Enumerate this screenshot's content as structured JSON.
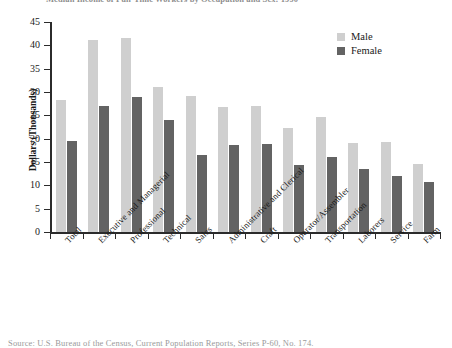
{
  "chart_data": {
    "type": "bar",
    "title": "Median Income of Full-Time Workers by Occupation and Sex: 1990",
    "xlabel": "",
    "ylabel": "Dollars (Thousands)",
    "ylim": [
      0,
      45
    ],
    "yticks": [
      0,
      5,
      10,
      15,
      20,
      25,
      30,
      35,
      40,
      45
    ],
    "grid": false,
    "legend_position": "top-right",
    "categories": [
      "Total",
      "Executive and Managerial",
      "Professional",
      "Technical",
      "Sales",
      "Administrative and Clerical",
      "Craft",
      "Operator/Assembler",
      "Transportation",
      "Laborers",
      "Service",
      "Farm"
    ],
    "series": [
      {
        "name": "Male",
        "color": "#cfcfcf",
        "values": [
          28.3,
          41.2,
          41.6,
          31.0,
          29.2,
          26.8,
          26.9,
          22.3,
          24.6,
          19.0,
          19.3,
          14.5
        ]
      },
      {
        "name": "Female",
        "color": "#636363",
        "values": [
          19.6,
          27.1,
          28.9,
          23.9,
          16.6,
          18.7,
          18.8,
          14.4,
          16.1,
          13.6,
          12.1,
          10.8
        ]
      }
    ]
  },
  "source_note": "Source:  U.S. Bureau of the Census, Current Population Reports, Series P-60, No. 174."
}
